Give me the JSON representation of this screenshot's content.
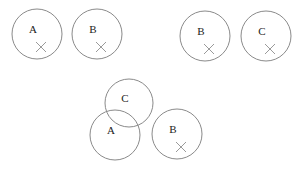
{
  "panels": [
    {
      "name": "panel-top-left",
      "circles": [
        {
          "label": "A",
          "cx": 37,
          "cy": 34,
          "r": 25,
          "has_cross": true
        },
        {
          "label": "B",
          "cx": 97,
          "cy": 34,
          "r": 25,
          "has_cross": true
        }
      ]
    },
    {
      "name": "panel-top-right",
      "circles": [
        {
          "label": "B",
          "cx": 205,
          "cy": 36,
          "r": 25,
          "has_cross": true
        },
        {
          "label": "C",
          "cx": 266,
          "cy": 36,
          "r": 25,
          "has_cross": true
        }
      ]
    },
    {
      "name": "panel-bottom",
      "circles": [
        {
          "label": "C",
          "cx": 129,
          "cy": 103,
          "r": 24,
          "has_cross": false
        },
        {
          "label": "A",
          "cx": 115,
          "cy": 135,
          "r": 25,
          "has_cross": false
        },
        {
          "label": "B",
          "cx": 177,
          "cy": 134,
          "r": 25,
          "has_cross": true
        }
      ]
    }
  ],
  "colors": {
    "stroke": "#8a8a8a",
    "text": "#222222",
    "background": "#ffffff"
  }
}
